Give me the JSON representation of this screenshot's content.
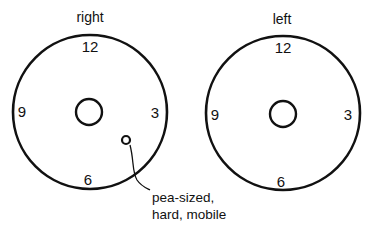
{
  "diagrams": [
    {
      "title": "right",
      "clock": {
        "top": "12",
        "right": "3",
        "bottom": "6",
        "left": "9"
      },
      "finding": {
        "clock_position": "between 4 and 5",
        "annotation_line1": "pea-sized,",
        "annotation_line2": "hard, mobile"
      }
    },
    {
      "title": "left",
      "clock": {
        "top": "12",
        "right": "3",
        "bottom": "6",
        "left": "9"
      }
    }
  ],
  "colors": {
    "stroke": "#111111",
    "background": "#ffffff"
  }
}
